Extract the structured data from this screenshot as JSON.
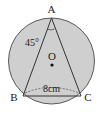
{
  "diagram": {
    "type": "circle-inscribed-triangle",
    "colors": {
      "circle_fill": "#cfcfcf",
      "stroke": "#333333",
      "background": "#ffffff"
    },
    "circle": {
      "center_label": "O"
    },
    "vertices": {
      "A": "A",
      "B": "B",
      "C": "C"
    },
    "angle_label": "45°",
    "side_label": "8cm"
  }
}
